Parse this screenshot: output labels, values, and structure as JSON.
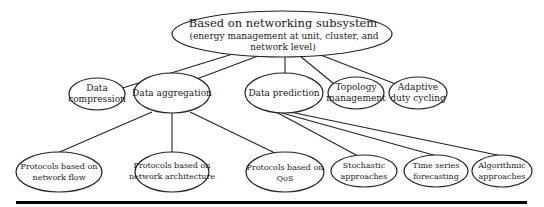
{
  "diagram": {
    "root": {
      "line1": "Based on networking subsystem",
      "line2": "(energy management at unit, cluster, and",
      "line3": "network level)"
    },
    "level2": [
      {
        "id": "data-compression",
        "lines": [
          "Data",
          "compression"
        ]
      },
      {
        "id": "data-aggregation",
        "lines": [
          "Data aggregation"
        ]
      },
      {
        "id": "data-prediction",
        "lines": [
          "Data prediction"
        ]
      },
      {
        "id": "topology-management",
        "lines": [
          "Topology",
          "management"
        ]
      },
      {
        "id": "adaptive-duty-cycling",
        "lines": [
          "Adaptive",
          "duty cycling"
        ]
      }
    ],
    "level3": [
      {
        "id": "protocols-network-flow",
        "parent": "data-aggregation",
        "lines": [
          "Protocols based on",
          "network flow"
        ]
      },
      {
        "id": "protocols-network-architecture",
        "parent": "data-aggregation",
        "lines": [
          "Protocols based on",
          "network architecture"
        ]
      },
      {
        "id": "protocols-qos",
        "parent": "data-aggregation",
        "lines": [
          "Protocols based on",
          "QoS"
        ]
      },
      {
        "id": "stochastic-approaches",
        "parent": "data-prediction",
        "lines": [
          "Stochastic",
          "approaches"
        ]
      },
      {
        "id": "time-series-forecasting",
        "parent": "data-prediction",
        "lines": [
          "Time series",
          "forecasting"
        ]
      },
      {
        "id": "algorithmic-approaches",
        "parent": "data-prediction",
        "lines": [
          "Algorithmic",
          "approaches"
        ]
      }
    ]
  }
}
